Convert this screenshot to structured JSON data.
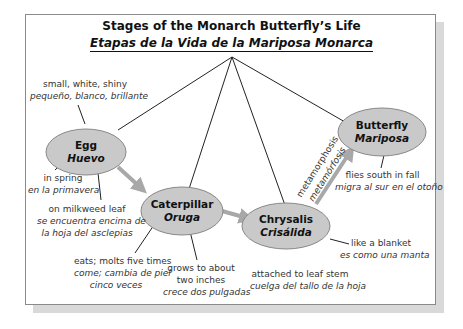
{
  "title": {
    "english": "Stages of the Monarch Butterfly’s Life",
    "spanish": "Etapas de la Vida de la Mariposa Monarca"
  },
  "colors": {
    "node_fill": "#c9c9c9",
    "node_stroke": "#888888",
    "arrow": "#a8a8a8",
    "line": "#222222"
  },
  "nodes": {
    "egg": {
      "en": "Egg",
      "es": "Huevo"
    },
    "caterpillar": {
      "en": "Caterpillar",
      "es": "Oruga"
    },
    "chrysalis": {
      "en": "Chrysalis",
      "es": "Crisálida"
    },
    "butterfly": {
      "en": "Butterfly",
      "es": "Mariposa"
    }
  },
  "labels": {
    "egg_desc": {
      "en": "small, white, shiny",
      "es": "pequeño, blanco, brillante"
    },
    "egg_when": {
      "en": "in spring",
      "es": "en la primavera"
    },
    "egg_where": {
      "en": "on milkweed leaf",
      "es1": "se encuentra encima de",
      "es2": "la hoja del asclepias"
    },
    "cat_eats": {
      "en": "eats; molts five times",
      "es1": "come; cambia de piel",
      "es2": "cinco veces"
    },
    "cat_grows": {
      "en1": "grows to about",
      "en2": "two inches",
      "es": "crece dos pulgadas"
    },
    "chr_attached": {
      "en": "attached to leaf stem",
      "es": "cuelga del tallo de la hoja"
    },
    "chr_blanket": {
      "en": "like a blanket",
      "es": "es como una manta"
    },
    "but_flies": {
      "en": "flies south in fall",
      "es": "migra al sur en el otoño"
    },
    "metamorphosis": {
      "en": "metamorphosis",
      "es": "metamórfosis"
    }
  }
}
